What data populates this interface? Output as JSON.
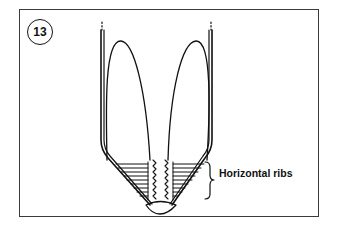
{
  "figure": {
    "number": "13",
    "callout": "Horizontal ribs",
    "colors": {
      "stroke": "#111111",
      "frame": "#3a3a3a",
      "background": "#ffffff"
    }
  }
}
